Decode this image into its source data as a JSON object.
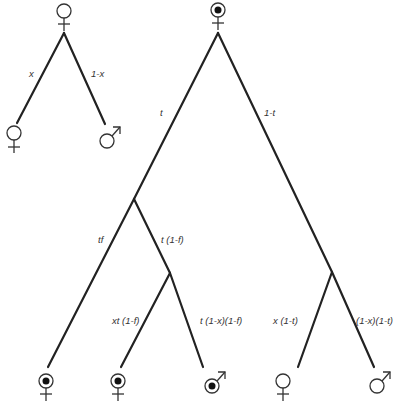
{
  "diagram": {
    "type": "probability-tree",
    "left_tree": {
      "root": {
        "symbol": "female"
      },
      "edges": [
        {
          "label": "x",
          "to": "female"
        },
        {
          "label": "1-x",
          "to": "male"
        }
      ]
    },
    "main_tree": {
      "root": {
        "symbol": "female-marked"
      },
      "edges": {
        "root_left": "t",
        "root_right": "1-t",
        "t_left": "tf",
        "t_right": "t (1-f)",
        "tf_sub_left": "xt (1-f)",
        "tf_sub_right": "t (1-x)(1-f)",
        "r_left": "x (1-t)",
        "r_right": "(1-x)(1-t)"
      },
      "leaves": [
        {
          "symbol": "female-marked"
        },
        {
          "symbol": "female-marked"
        },
        {
          "symbol": "male-marked"
        },
        {
          "symbol": "female"
        },
        {
          "symbol": "male"
        }
      ]
    }
  },
  "colors": {
    "line": "#222222",
    "symbol": "#333333",
    "label": "#333333"
  }
}
